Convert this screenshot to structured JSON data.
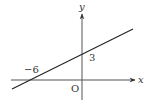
{
  "diagram": {
    "type": "coordinate-graph",
    "axes": {
      "x_label": "x",
      "y_label": "y",
      "origin_label": "O"
    },
    "line": {
      "description": "straight line with positive slope",
      "x_intercept": -6,
      "y_intercept": 3,
      "x_intercept_label": "−6",
      "y_intercept_label": "3"
    },
    "colors": {
      "stroke": "#222222",
      "text": "#333333",
      "background": "#ffffff"
    }
  }
}
